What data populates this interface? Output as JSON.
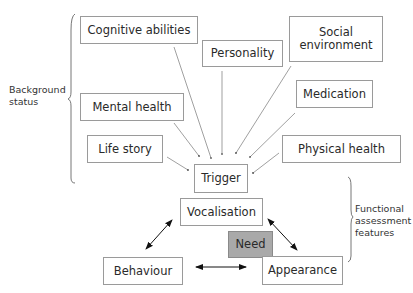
{
  "diagram": {
    "background_group": {
      "label_line1": "Background",
      "label_line2": "status",
      "factors": [
        {
          "id": "cognitive",
          "label": "Cognitive abilities"
        },
        {
          "id": "personality",
          "label": "Personality"
        },
        {
          "id": "social",
          "label_line1": "Social",
          "label_line2": "environment"
        },
        {
          "id": "mental",
          "label": "Mental health"
        },
        {
          "id": "medication",
          "label": "Medication"
        },
        {
          "id": "lifestory",
          "label": "Life story"
        },
        {
          "id": "physical",
          "label": "Physical health"
        }
      ]
    },
    "trigger": {
      "label": "Trigger"
    },
    "functional_group": {
      "label_line1": "Functional",
      "label_line2": "assessment",
      "label_line3": "features",
      "nodes": [
        {
          "id": "vocalisation",
          "label": "Vocalisation"
        },
        {
          "id": "need",
          "label": "Need",
          "fill": "#a9a9a9"
        },
        {
          "id": "behaviour",
          "label": "Behaviour"
        },
        {
          "id": "appearance",
          "label": "Appearance"
        }
      ]
    },
    "edges": [
      {
        "from": "Cognitive abilities",
        "to": "Trigger",
        "type": "arrow"
      },
      {
        "from": "Personality",
        "to": "Trigger",
        "type": "arrow"
      },
      {
        "from": "Social environment",
        "to": "Trigger",
        "type": "arrow"
      },
      {
        "from": "Mental health",
        "to": "Trigger",
        "type": "arrow"
      },
      {
        "from": "Medication",
        "to": "Trigger",
        "type": "arrow"
      },
      {
        "from": "Life story",
        "to": "Trigger",
        "type": "arrow"
      },
      {
        "from": "Physical health",
        "to": "Trigger",
        "type": "arrow"
      },
      {
        "from": "Vocalisation",
        "to": "Behaviour",
        "type": "double-arrow"
      },
      {
        "from": "Vocalisation",
        "to": "Appearance",
        "type": "double-arrow"
      },
      {
        "from": "Behaviour",
        "to": "Appearance",
        "type": "double-arrow"
      }
    ]
  }
}
